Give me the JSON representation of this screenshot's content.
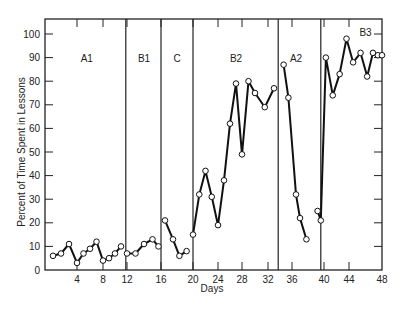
{
  "chart_data": {
    "type": "line",
    "title": "",
    "xlabel": "Days",
    "ylabel": "Percent of Time Spent in Lessons",
    "xlim": [
      0,
      48
    ],
    "ylim": [
      0,
      100
    ],
    "grid": false,
    "legend": "none",
    "x_ticks": [
      4,
      8,
      12,
      16,
      20,
      24,
      28,
      32,
      36,
      40,
      44,
      48
    ],
    "y_ticks": [
      0,
      10,
      20,
      30,
      40,
      50,
      60,
      70,
      80,
      90,
      100
    ],
    "phase_lines": [
      11.8,
      16,
      20,
      33.7,
      39.6
    ],
    "phases": [
      {
        "label": "A1",
        "x": 5.5,
        "y": 90
      },
      {
        "label": "B1",
        "x": 14,
        "y": 90
      },
      {
        "label": "C",
        "x": 18,
        "y": 90
      },
      {
        "label": "B2",
        "x": 27,
        "y": 90
      },
      {
        "label": "A2",
        "x": 36.5,
        "y": 90
      },
      {
        "label": "B3",
        "x": 46,
        "y": 101
      }
    ],
    "series": [
      {
        "name": "A1",
        "x": [
          1,
          2,
          3,
          4,
          5,
          6,
          7,
          8,
          9,
          10,
          11
        ],
        "values": [
          6,
          7,
          11,
          3,
          7,
          9,
          12,
          4,
          5,
          7,
          10
        ]
      },
      {
        "name": "B1",
        "x": [
          12,
          13,
          14,
          15,
          15.7
        ],
        "values": [
          7,
          7,
          11,
          13,
          10
        ]
      },
      {
        "name": "C",
        "x": [
          16.5,
          17.5,
          18.3,
          19.2
        ],
        "values": [
          21,
          13,
          6,
          8
        ]
      },
      {
        "name": "B2",
        "x": [
          20,
          21,
          22,
          23,
          24,
          25,
          26,
          27,
          28,
          29,
          30,
          31.5,
          33
        ],
        "values": [
          15,
          32,
          42,
          31,
          19,
          38,
          62,
          79,
          49,
          80,
          75,
          69,
          77
        ]
      },
      {
        "name": "A2",
        "x": [
          34.6,
          35.4,
          36.5,
          37,
          37.8
        ],
        "values": [
          87,
          73,
          32,
          22,
          13
        ]
      },
      {
        "name": "B3",
        "x": [
          39.2,
          39.6,
          40.3,
          41.4,
          42.5,
          43.6,
          44.5,
          45.4,
          46.2,
          46.9,
          47.5,
          48
        ],
        "values": [
          25,
          21,
          90,
          74,
          83,
          98,
          88,
          92,
          82,
          92,
          91,
          91
        ]
      }
    ]
  },
  "axis": {
    "x_label": "Days",
    "y_label": "Percent of Time Spent in Lessons"
  }
}
